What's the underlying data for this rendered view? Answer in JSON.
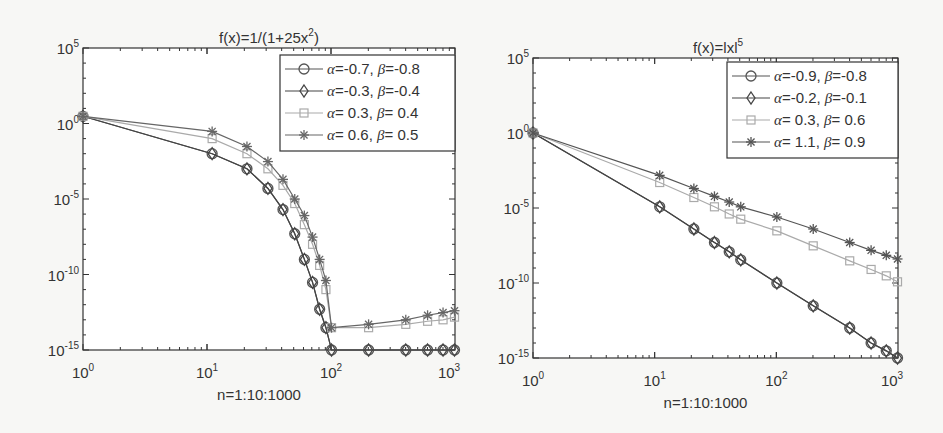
{
  "chart_data": [
    {
      "type": "line",
      "title": "f(x)=1/(1+25x^2)",
      "title_base": "f(x)=1/(1+25x",
      "title_sup": "2",
      "title_tail": ")",
      "xlabel": "n=1:10:1000",
      "ylabel": "",
      "xscale": "log",
      "yscale": "log",
      "xlim": [
        1,
        1000
      ],
      "ylim": [
        1e-15,
        100000.0
      ],
      "xticks": [
        {
          "base": "10",
          "exp": "0"
        },
        {
          "base": "10",
          "exp": "1"
        },
        {
          "base": "10",
          "exp": "2"
        },
        {
          "base": "10",
          "exp": "3"
        }
      ],
      "yticks": [
        {
          "base": "10",
          "exp": "5"
        },
        {
          "base": "10",
          "exp": "0"
        },
        {
          "base": "10",
          "exp": "-5"
        },
        {
          "base": "10",
          "exp": "-10"
        },
        {
          "base": "10",
          "exp": "-15"
        }
      ],
      "legend_position": "upper right",
      "x": [
        1,
        11,
        21,
        31,
        41,
        51,
        61,
        71,
        81,
        91,
        101,
        201,
        401,
        601,
        801,
        991
      ],
      "series": [
        {
          "name": "α=-0.7, β=-0.8",
          "alpha": "-0.7",
          "beta": "-0.8",
          "marker": "circle",
          "color": "#555555",
          "values": [
            3,
            0.01,
            0.001,
            5e-05,
            2e-06,
            5e-08,
            1e-09,
            3e-11,
            5e-13,
            3e-14,
            1e-15,
            1e-15,
            1e-15,
            1e-15,
            1e-15,
            1e-15
          ]
        },
        {
          "name": "α=-0.3, β=-0.4",
          "alpha": "-0.3",
          "beta": "-0.4",
          "marker": "diamond",
          "color": "#444444",
          "values": [
            3,
            0.01,
            0.001,
            5e-05,
            2e-06,
            5e-08,
            1e-09,
            3e-11,
            5e-13,
            3e-14,
            1e-15,
            1e-15,
            1e-15,
            1e-15,
            1e-15,
            1e-15
          ]
        },
        {
          "name": "α= 0.3, β= 0.4",
          "alpha": "0.3",
          "beta": "0.4",
          "marker": "square",
          "color": "#aaaaaa",
          "values": [
            3,
            0.1,
            0.01,
            0.001,
            8e-05,
            5e-06,
            2e-07,
            1e-08,
            4e-10,
            1e-11,
            3e-14,
            3e-14,
            5e-14,
            8e-14,
            1e-13,
            1.5e-13
          ]
        },
        {
          "name": "α= 0.6, β= 0.5",
          "alpha": "0.6",
          "beta": "0.5",
          "marker": "asterisk",
          "color": "#666666",
          "values": [
            3,
            0.3,
            0.03,
            0.003,
            0.0002,
            1e-05,
            8e-07,
            3e-08,
            1e-09,
            4e-11,
            3e-14,
            5e-14,
            1e-13,
            2e-13,
            3e-13,
            4e-13
          ]
        }
      ]
    },
    {
      "type": "line",
      "title": "f(x)=|x|^5",
      "title_base": "f(x)=lxl",
      "title_sup": "5",
      "title_tail": "",
      "xlabel": "n=1:10:1000",
      "ylabel": "",
      "xscale": "log",
      "yscale": "log",
      "xlim": [
        1,
        1000
      ],
      "ylim": [
        1e-15,
        100000.0
      ],
      "xticks": [
        {
          "base": "10",
          "exp": "0"
        },
        {
          "base": "10",
          "exp": "1"
        },
        {
          "base": "10",
          "exp": "2"
        },
        {
          "base": "10",
          "exp": "3"
        }
      ],
      "yticks": [
        {
          "base": "10",
          "exp": "5"
        },
        {
          "base": "10",
          "exp": "0"
        },
        {
          "base": "10",
          "exp": "-5"
        },
        {
          "base": "10",
          "exp": "-10"
        },
        {
          "base": "10",
          "exp": "-15"
        }
      ],
      "legend_position": "upper right",
      "x": [
        1,
        11,
        21,
        31,
        41,
        51,
        101,
        201,
        401,
        601,
        801,
        991
      ],
      "series": [
        {
          "name": "α=-0.9, β=-0.8",
          "alpha": "-0.9",
          "beta": "-0.8",
          "marker": "circle",
          "color": "#555555",
          "values": [
            1,
            1.2e-05,
            4e-07,
            5e-08,
            1.2e-08,
            3.5e-09,
            1e-10,
            3e-12,
            1e-13,
            1e-14,
            3e-15,
            1e-15
          ]
        },
        {
          "name": "α=-0.2, β=-0.1",
          "alpha": "-0.2",
          "beta": "-0.1",
          "marker": "diamond",
          "color": "#444444",
          "values": [
            1,
            1.2e-05,
            4e-07,
            5e-08,
            1.2e-08,
            3.5e-09,
            1e-10,
            3e-12,
            1e-13,
            1e-14,
            3e-15,
            1e-15
          ]
        },
        {
          "name": "α= 0.3, β= 0.6",
          "alpha": "0.3",
          "beta": "0.6",
          "marker": "square",
          "color": "#aaaaaa",
          "values": [
            1,
            0.0005,
            5e-05,
            1.2e-05,
            4e-06,
            1.8e-06,
            3e-07,
            3e-08,
            3e-09,
            8e-10,
            3e-10,
            1.2e-10
          ]
        },
        {
          "name": "α= 1.1, β= 0.9",
          "alpha": "1.1",
          "beta": "0.9",
          "marker": "asterisk",
          "color": "#555555",
          "values": [
            1,
            0.0015,
            0.0002,
            6e-05,
            2.5e-05,
            1.2e-05,
            2.5e-06,
            4e-07,
            5e-08,
            1.5e-08,
            7e-09,
            4e-09
          ]
        }
      ]
    }
  ]
}
